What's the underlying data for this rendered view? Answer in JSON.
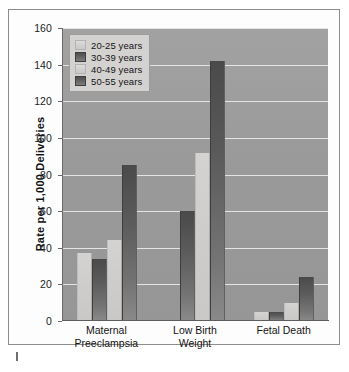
{
  "chart_data": {
    "type": "bar",
    "title": "",
    "xlabel": "",
    "ylabel": "Rate per 1,000 Deliveries",
    "ylim": [
      0,
      160
    ],
    "ytick_step": 20,
    "yticks": [
      "160",
      "140",
      "120",
      "100",
      "80",
      "60",
      "40",
      "20",
      "0"
    ],
    "grid": true,
    "legend_position": "top-left",
    "categories": [
      "Maternal Preeclampsia",
      "Low Birth Weight",
      "Fetal Death"
    ],
    "category_lines": [
      [
        "Maternal",
        "Preeclampsia"
      ],
      [
        "Low Birth",
        "Weight"
      ],
      [
        "Fetal Death",
        ""
      ]
    ],
    "series": [
      {
        "name": "20-25 years",
        "swatch": "light",
        "values": [
          37,
          0,
          5
        ]
      },
      {
        "name": "30-39 years",
        "swatch": "dark",
        "values": [
          34,
          60,
          5
        ]
      },
      {
        "name": "40-49 years",
        "swatch": "light",
        "values": [
          44,
          92,
          10
        ]
      },
      {
        "name": "50-55 years",
        "swatch": "dark",
        "values": [
          85,
          142,
          24
        ]
      }
    ]
  },
  "colors": {
    "plot_background": "#9b9b9b",
    "gridline": "#eceaea",
    "bar_light": "#cfcecc",
    "bar_dark": "#5a5a5a",
    "legend_background": "#d3d2d0",
    "frame_border": "#8d8d8d",
    "text": "#141414"
  }
}
